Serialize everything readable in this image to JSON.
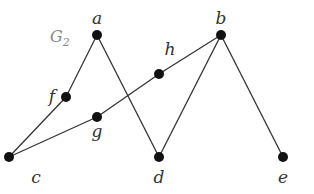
{
  "graph": {
    "title": "G",
    "title_subscript": "2",
    "nodes": [
      {
        "id": "a",
        "label": "a",
        "x": 97,
        "y": 35,
        "lx": 97,
        "ly": 24
      },
      {
        "id": "b",
        "label": "b",
        "x": 221,
        "y": 35,
        "lx": 221,
        "ly": 24
      },
      {
        "id": "h",
        "label": "h",
        "x": 159,
        "y": 74,
        "lx": 170,
        "ly": 55
      },
      {
        "id": "f",
        "label": "f",
        "x": 66,
        "y": 97,
        "lx": 52,
        "ly": 102
      },
      {
        "id": "g",
        "label": "g",
        "x": 97,
        "y": 117,
        "lx": 97,
        "ly": 137
      },
      {
        "id": "c",
        "label": "c",
        "x": 9,
        "y": 157,
        "lx": 36,
        "ly": 183
      },
      {
        "id": "d",
        "label": "d",
        "x": 159,
        "y": 157,
        "lx": 159,
        "ly": 183
      },
      {
        "id": "e",
        "label": "e",
        "x": 283,
        "y": 157,
        "lx": 283,
        "ly": 183
      }
    ],
    "edges": [
      [
        "a",
        "f"
      ],
      [
        "f",
        "c"
      ],
      [
        "a",
        "d"
      ],
      [
        "c",
        "g"
      ],
      [
        "g",
        "h"
      ],
      [
        "h",
        "b"
      ],
      [
        "b",
        "d"
      ],
      [
        "b",
        "e"
      ]
    ],
    "colors": {
      "node": "#111111",
      "edge": "#333333",
      "label": "#333333",
      "title": "#888888"
    }
  }
}
